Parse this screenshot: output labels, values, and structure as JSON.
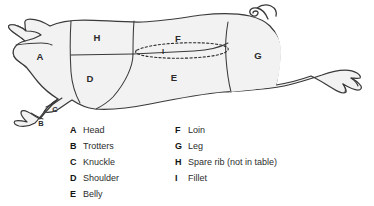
{
  "diagram": {
    "colors": {
      "fill": "#f2f2f2",
      "stroke": "#3a3a3a",
      "label": "#2b2b2b",
      "background": "#ffffff"
    },
    "cut_labels": [
      {
        "key": "A",
        "x": 40,
        "y": 57,
        "region": "head"
      },
      {
        "key": "B",
        "x": 41,
        "y": 124,
        "region": "trotters"
      },
      {
        "key": "C",
        "x": 55,
        "y": 110,
        "region": "knuckle"
      },
      {
        "key": "D",
        "x": 90,
        "y": 79,
        "region": "shoulder"
      },
      {
        "key": "E",
        "x": 174,
        "y": 78,
        "region": "belly"
      },
      {
        "key": "F",
        "x": 178,
        "y": 39,
        "region": "loin"
      },
      {
        "key": "G",
        "x": 258,
        "y": 56,
        "region": "leg"
      },
      {
        "key": "H",
        "x": 97,
        "y": 38,
        "region": "spare-rib"
      },
      {
        "key": "I",
        "x": 163,
        "y": 52,
        "region": "fillet"
      }
    ]
  },
  "legend": {
    "left_column": [
      {
        "key": "A",
        "name": "Head"
      },
      {
        "key": "B",
        "name": "Trotters"
      },
      {
        "key": "C",
        "name": "Knuckle"
      },
      {
        "key": "D",
        "name": "Shoulder"
      },
      {
        "key": "E",
        "name": "Belly"
      }
    ],
    "right_column": [
      {
        "key": "F",
        "name": "Loin"
      },
      {
        "key": "G",
        "name": "Leg"
      },
      {
        "key": "H",
        "name": "Spare rib (not in table)"
      },
      {
        "key": "I",
        "name": "Fillet"
      }
    ]
  }
}
